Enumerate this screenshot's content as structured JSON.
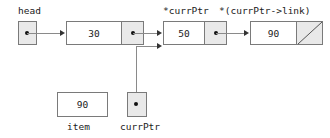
{
  "diagram": {
    "labels": {
      "head": "head",
      "curr_ptr_deref": "*currPtr",
      "next_node_deref": "*(currPtr->link)",
      "item": "item",
      "curr_ptr": "currPtr"
    },
    "nodes": [
      {
        "name": "node-30",
        "value": "30",
        "link": "pointer-to-node-50"
      },
      {
        "name": "node-50",
        "value": "50",
        "link": "pointer-to-node-90"
      },
      {
        "name": "node-90",
        "value": "90",
        "link": "null"
      }
    ],
    "variables": [
      {
        "name": "head",
        "kind": "pointer",
        "value": "pointer-to-node-30"
      },
      {
        "name": "item",
        "kind": "value",
        "value": "90"
      },
      {
        "name": "currPtr",
        "kind": "pointer",
        "value": "pointer-to-node-50"
      }
    ],
    "colors": {
      "pointer_cell_fill": "#e9e9e9",
      "box_border": "#7a7a7a",
      "line": "#8a8a8a",
      "text": "#1a1a1a",
      "background": "#ffffff"
    }
  }
}
